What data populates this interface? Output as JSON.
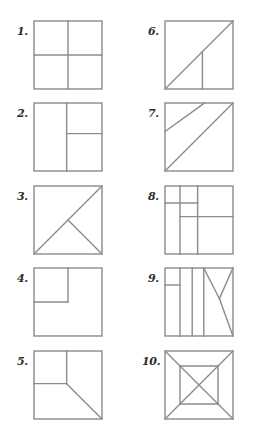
{
  "page": {
    "background_color": "#ffffff",
    "line_color": "#8d8d8d",
    "label_color": "#2b2b2b",
    "width": 262,
    "height": 439
  },
  "layout": {
    "columns": 2,
    "rows": 5,
    "square_size": 67,
    "column_label_x": [
      17,
      148
    ],
    "column_square_x": [
      34,
      165
    ],
    "row_label_y": [
      26,
      108,
      191,
      273,
      356
    ],
    "row_square_y": [
      21,
      103,
      186,
      268,
      351
    ]
  },
  "puzzles": [
    {
      "label": "1.",
      "name": "four-quadrants",
      "column": 0,
      "row": 0,
      "lines": [
        {
          "x1": 50,
          "y1": 0,
          "x2": 50,
          "y2": 100
        },
        {
          "x1": 0,
          "y1": 50,
          "x2": 100,
          "y2": 50
        }
      ]
    },
    {
      "label": "2.",
      "name": "left-half-right-split",
      "column": 0,
      "row": 1,
      "lines": [
        {
          "x1": 48,
          "y1": 0,
          "x2": 48,
          "y2": 100
        },
        {
          "x1": 48,
          "y1": 45,
          "x2": 100,
          "y2": 45
        }
      ]
    },
    {
      "label": "3.",
      "name": "diagonal-with-center-spur",
      "column": 0,
      "row": 2,
      "lines": [
        {
          "x1": 0,
          "y1": 100,
          "x2": 100,
          "y2": 0
        },
        {
          "x1": 50,
          "y1": 50,
          "x2": 100,
          "y2": 100
        }
      ]
    },
    {
      "label": "4.",
      "name": "corner-square-top-left",
      "column": 0,
      "row": 3,
      "lines": [
        {
          "x1": 50,
          "y1": 0,
          "x2": 50,
          "y2": 50
        },
        {
          "x1": 0,
          "y1": 50,
          "x2": 50,
          "y2": 50
        }
      ]
    },
    {
      "label": "5.",
      "name": "corner-square-with-diagonal",
      "column": 0,
      "row": 4,
      "lines": [
        {
          "x1": 48,
          "y1": 0,
          "x2": 48,
          "y2": 48
        },
        {
          "x1": 0,
          "y1": 48,
          "x2": 48,
          "y2": 48
        },
        {
          "x1": 48,
          "y1": 48,
          "x2": 100,
          "y2": 100
        }
      ]
    },
    {
      "label": "6.",
      "name": "diagonal-with-vertical-spur",
      "column": 1,
      "row": 0,
      "lines": [
        {
          "x1": 0,
          "y1": 100,
          "x2": 100,
          "y2": 0
        },
        {
          "x1": 55,
          "y1": 45,
          "x2": 55,
          "y2": 100
        }
      ]
    },
    {
      "label": "7.",
      "name": "two-parallel-diagonals",
      "column": 1,
      "row": 1,
      "lines": [
        {
          "x1": 0,
          "y1": 100,
          "x2": 100,
          "y2": 0
        },
        {
          "x1": 0,
          "y1": 42,
          "x2": 58,
          "y2": 0
        }
      ]
    },
    {
      "label": "8.",
      "name": "offset-grid-blocks",
      "column": 1,
      "row": 2,
      "lines": [
        {
          "x1": 22,
          "y1": 0,
          "x2": 22,
          "y2": 100
        },
        {
          "x1": 48,
          "y1": 0,
          "x2": 48,
          "y2": 100
        },
        {
          "x1": 0,
          "y1": 25,
          "x2": 48,
          "y2": 25
        },
        {
          "x1": 22,
          "y1": 45,
          "x2": 100,
          "y2": 45
        }
      ]
    },
    {
      "label": "9.",
      "name": "vertical-strips-with-zigzag",
      "column": 1,
      "row": 3,
      "lines": [
        {
          "x1": 22,
          "y1": 0,
          "x2": 22,
          "y2": 100
        },
        {
          "x1": 40,
          "y1": 0,
          "x2": 40,
          "y2": 100
        },
        {
          "x1": 57,
          "y1": 0,
          "x2": 57,
          "y2": 100
        },
        {
          "x1": 0,
          "y1": 25,
          "x2": 22,
          "y2": 25
        },
        {
          "x1": 57,
          "y1": 0,
          "x2": 80,
          "y2": 45
        },
        {
          "x1": 80,
          "y1": 45,
          "x2": 100,
          "y2": 0
        },
        {
          "x1": 80,
          "y1": 45,
          "x2": 100,
          "y2": 100
        }
      ]
    },
    {
      "label": "10.",
      "name": "nested-square-with-diagonals",
      "column": 1,
      "row": 4,
      "lines": [
        {
          "x1": 22,
          "y1": 22,
          "x2": 78,
          "y2": 22
        },
        {
          "x1": 78,
          "y1": 22,
          "x2": 78,
          "y2": 78
        },
        {
          "x1": 78,
          "y1": 78,
          "x2": 22,
          "y2": 78
        },
        {
          "x1": 22,
          "y1": 78,
          "x2": 22,
          "y2": 22
        },
        {
          "x1": 22,
          "y1": 22,
          "x2": 78,
          "y2": 78
        },
        {
          "x1": 78,
          "y1": 22,
          "x2": 22,
          "y2": 78
        },
        {
          "x1": 0,
          "y1": 0,
          "x2": 22,
          "y2": 22
        },
        {
          "x1": 100,
          "y1": 0,
          "x2": 78,
          "y2": 22
        },
        {
          "x1": 100,
          "y1": 100,
          "x2": 78,
          "y2": 78
        },
        {
          "x1": 0,
          "y1": 100,
          "x2": 22,
          "y2": 78
        }
      ]
    }
  ]
}
